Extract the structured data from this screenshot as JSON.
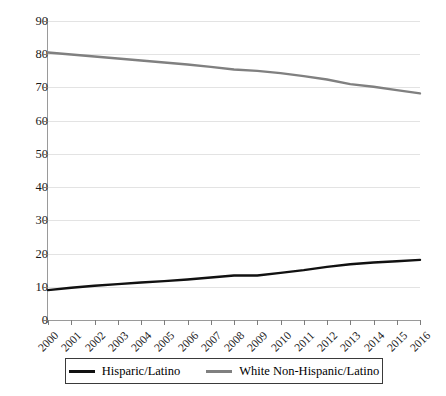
{
  "chart_data": {
    "type": "line",
    "title": "",
    "subtitle": "",
    "xlabel": "",
    "ylabel": "",
    "grid": "horizontal",
    "legend_position": "bottom",
    "ylim": [
      0,
      90
    ],
    "ytick_step": 10,
    "y_ticks": [
      "0",
      "10",
      "20",
      "30",
      "40",
      "50",
      "60",
      "70",
      "80",
      "90"
    ],
    "categories": [
      "2000",
      "2001",
      "2002",
      "2003",
      "2004",
      "2005",
      "2006",
      "2007",
      "2008",
      "2009",
      "2010",
      "2011",
      "2012",
      "2013",
      "2014",
      "2015",
      "2016"
    ],
    "series": [
      {
        "name": "Hisparic/Latino",
        "color": "#111111",
        "values": [
          9.0,
          9.7,
          10.3,
          10.8,
          11.3,
          11.7,
          12.2,
          12.8,
          13.4,
          13.4,
          14.2,
          15.0,
          16.0,
          16.8,
          17.3,
          17.7,
          18.1
        ]
      },
      {
        "name": "White Non-Hispanic/Latino",
        "color": "#808080",
        "values": [
          80.5,
          79.9,
          79.3,
          78.7,
          78.1,
          77.5,
          76.9,
          76.2,
          75.4,
          75.0,
          74.3,
          73.4,
          72.4,
          71.0,
          70.2,
          69.2,
          68.2
        ]
      }
    ]
  },
  "legend": {
    "entries": [
      {
        "label": "Hisparic/Latino",
        "color": "#111111"
      },
      {
        "label": "White Non-Hispanic/Latino",
        "color": "#808080"
      }
    ]
  }
}
